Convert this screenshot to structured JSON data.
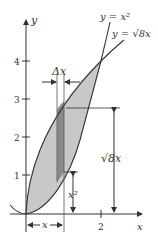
{
  "figure": {
    "curves": [
      {
        "name": "parabola",
        "label": "y = x²"
      },
      {
        "name": "root-curve",
        "label": "y = √8x"
      }
    ],
    "axes": {
      "x_label": "x",
      "y_label": "y",
      "x_ticks": [
        "2"
      ],
      "y_ticks": [
        "1",
        "2",
        "3",
        "4"
      ]
    },
    "annotations": {
      "delta_x": "Δx",
      "strip_height_label": "√8x",
      "lower_height_label": "x²",
      "base_width_label": "x"
    },
    "colors": {
      "region_fill": "#c8c8c8",
      "strip_fill": "#8a8a8a",
      "line": "#333333"
    }
  }
}
